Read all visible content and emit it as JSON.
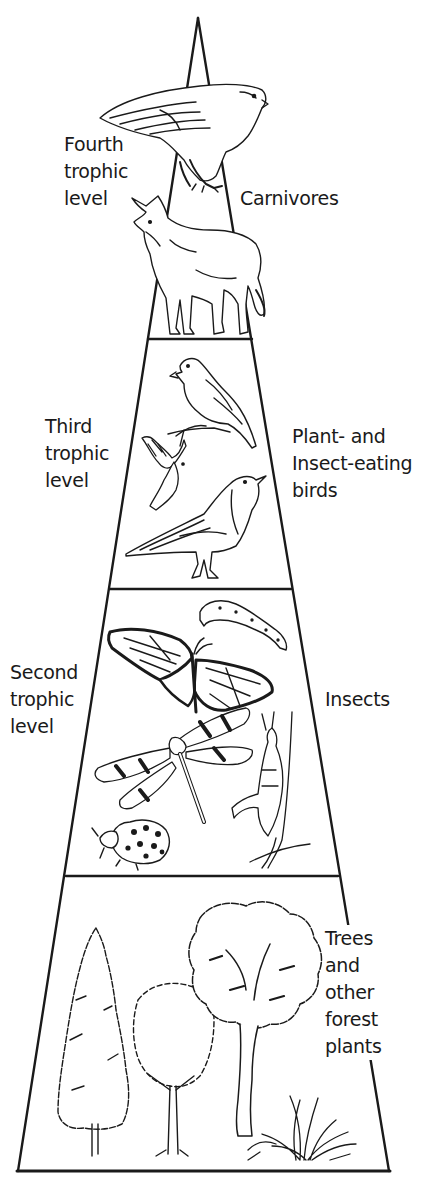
{
  "diagram": {
    "stroke_color": "#1a1a1a",
    "background_color": "#ffffff",
    "levels": [
      {
        "id": "fourth",
        "level_label": [
          "Fourth",
          "trophic",
          "level"
        ],
        "group_label": [
          "Carnivores"
        ],
        "organisms": [
          "hawk",
          "coyote"
        ]
      },
      {
        "id": "third",
        "level_label": [
          "Third",
          "trophic",
          "level"
        ],
        "group_label": [
          "Plant- and",
          "Insect-eating",
          "birds"
        ],
        "organisms": [
          "perched-finch",
          "flying-bird",
          "robin"
        ]
      },
      {
        "id": "second",
        "level_label": [
          "Second",
          "trophic",
          "level"
        ],
        "group_label": [
          "Insects"
        ],
        "organisms": [
          "caterpillar",
          "monarch-butterfly",
          "dragonfly",
          "grasshopper",
          "ladybug"
        ]
      },
      {
        "id": "first",
        "level_label": [],
        "group_label": [
          "Trees",
          "and",
          "other",
          "forest",
          "plants"
        ],
        "organisms": [
          "conifer-tree",
          "young-tree",
          "oak-tree",
          "grass-clump"
        ]
      }
    ]
  }
}
